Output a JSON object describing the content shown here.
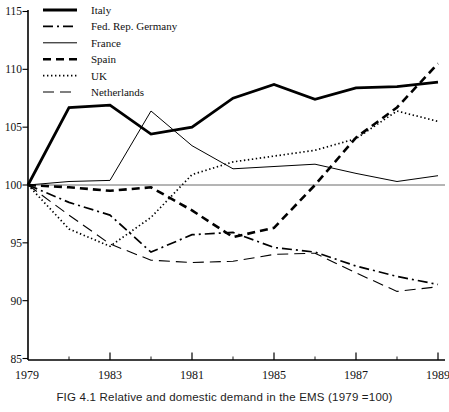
{
  "chart_data": {
    "type": "line",
    "title": "",
    "caption": "FIG 4.1 Relative and domestic demand in the EMS (1979 =100)",
    "x": [
      1979,
      1980,
      1981,
      1982,
      1983,
      1984,
      1985,
      1986,
      1987,
      1988,
      1989
    ],
    "x_printed_labels": [
      {
        "text": "1979",
        "at_year": 1979
      },
      {
        "text": "1983",
        "at_year": 1981
      },
      {
        "text": "1981",
        "at_year": 1983
      },
      {
        "text": "1985",
        "at_year": 1985
      },
      {
        "text": "1987",
        "at_year": 1987
      },
      {
        "text": "1989",
        "at_year": 1989
      }
    ],
    "xticks_major": [
      1981,
      1983,
      1985,
      1987,
      1989
    ],
    "xticks_minor": [
      1980,
      1982,
      1984,
      1986,
      1988
    ],
    "ylim": [
      85,
      115
    ],
    "yticks": [
      85,
      90,
      95,
      100,
      105,
      110,
      115
    ],
    "reference_line": 100,
    "grid": "none",
    "legend_position": "top-left-inside",
    "line_color": "#000000",
    "reference_line_color": "#444444",
    "background": "#ffffff",
    "series": [
      {
        "name": "Italy",
        "line_style": "solid-thick",
        "values": [
          100,
          106.7,
          106.9,
          104.4,
          105.0,
          107.5,
          108.7,
          107.4,
          108.4,
          108.5,
          108.9
        ]
      },
      {
        "name": "Fed. Rep. Germany",
        "line_style": "dash-dot",
        "values": [
          100,
          98.5,
          97.4,
          94.2,
          95.7,
          95.9,
          94.6,
          94.2,
          93.0,
          92.1,
          91.4
        ]
      },
      {
        "name": "France",
        "line_style": "solid-thin",
        "values": [
          100,
          100.3,
          100.4,
          106.4,
          103.4,
          101.4,
          101.6,
          101.8,
          101.0,
          100.3,
          100.8
        ]
      },
      {
        "name": "Spain",
        "line_style": "dashed-thick",
        "values": [
          100,
          99.8,
          99.5,
          99.8,
          97.8,
          95.5,
          96.3,
          100.0,
          104.1,
          106.7,
          110.5
        ]
      },
      {
        "name": "UK",
        "line_style": "dotted",
        "values": [
          100,
          96.2,
          94.7,
          97.2,
          100.9,
          102.0,
          102.5,
          103.0,
          104.0,
          106.4,
          105.5
        ]
      },
      {
        "name": "Netherlands",
        "line_style": "long-dash",
        "values": [
          100,
          97.4,
          94.9,
          93.5,
          93.3,
          93.4,
          94.0,
          94.1,
          92.4,
          90.8,
          91.2
        ]
      }
    ]
  }
}
